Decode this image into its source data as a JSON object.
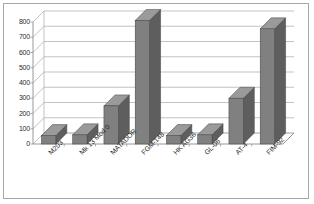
{
  "chart_data": {
    "type": "bar",
    "title": "",
    "subtitle": "",
    "xlabel": "",
    "ylabel": "",
    "categories": [
      "M203",
      "Mk 13 Mod 0",
      "MATADOR",
      "FGM-148",
      "HK AG36",
      "GL-06",
      "AT-4",
      "FIM-92"
    ],
    "values": [
      55,
      60,
      250,
      810,
      55,
      60,
      300,
      755
    ],
    "ylim": [
      0,
      800
    ],
    "ytick_labels": [
      "0",
      "100",
      "200",
      "300",
      "400",
      "500",
      "600",
      "700",
      "800"
    ],
    "ytick_values": [
      0,
      100,
      200,
      300,
      400,
      500,
      600,
      700,
      800
    ],
    "grid": true,
    "legend": false,
    "legend_position": "none",
    "style": "3d-column",
    "series": [
      {
        "name": "Series 1",
        "values": [
          55,
          60,
          250,
          810,
          55,
          60,
          300,
          755
        ]
      }
    ],
    "colors": {
      "bar_front": "#808080",
      "bar_side": "#5e5e5e",
      "bar_top": "#9a9a9a",
      "bar_outline": "#404040",
      "gridline": "#b4b4b4",
      "axis": "#8c8c8c",
      "frame_border": "#a8a8a8",
      "plot_background": "#ffffff",
      "text": "#2b2b2b"
    }
  }
}
